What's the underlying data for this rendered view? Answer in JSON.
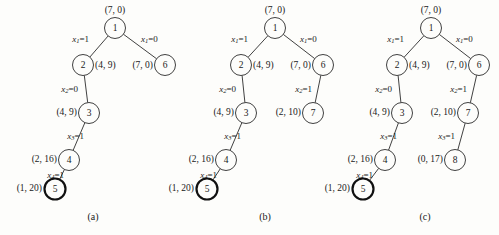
{
  "figure": {
    "background": "#fdfdfb",
    "ink": "#2b2b2b",
    "panels": [
      {
        "caption": "(a)",
        "caption_x": 93,
        "caption_y": 220,
        "nodes": [
          {
            "id": "n1",
            "label": "1",
            "x": 115,
            "y": 28,
            "r": 10.5,
            "goal": false,
            "pair": "(7, 0)",
            "pair_anchor": "mid",
            "pair_x": 115,
            "pair_y": 11
          },
          {
            "id": "n2",
            "label": "2",
            "x": 83,
            "y": 65,
            "r": 10.5,
            "goal": false,
            "pair": "(4, 9)",
            "pair_anchor": "left",
            "pair_x": 95,
            "pair_y": 66
          },
          {
            "id": "n6",
            "label": "6",
            "x": 165,
            "y": 65,
            "r": 10.5,
            "goal": false,
            "pair": "(7, 0)",
            "pair_anchor": "right",
            "pair_x": 153,
            "pair_y": 66
          },
          {
            "id": "n3",
            "label": "3",
            "x": 89,
            "y": 113,
            "r": 10.5,
            "goal": false,
            "pair": "(4, 9)",
            "pair_anchor": "right",
            "pair_x": 77,
            "pair_y": 113
          },
          {
            "id": "n4",
            "label": "4",
            "x": 69,
            "y": 160,
            "r": 10.5,
            "goal": false,
            "pair": "(2, 16)",
            "pair_anchor": "right",
            "pair_x": 57,
            "pair_y": 160
          },
          {
            "id": "n5",
            "label": "5",
            "x": 55,
            "y": 189,
            "r": 10.5,
            "goal": true,
            "pair": "(1, 20)",
            "pair_anchor": "right",
            "pair_x": 42,
            "pair_y": 189
          }
        ],
        "edges": [
          {
            "from": "n1",
            "to": "n2",
            "var": "x",
            "sub": "1",
            "val": "1",
            "lbl_x": 89,
            "lbl_y": 40,
            "lbl_anchor": "r"
          },
          {
            "from": "n1",
            "to": "n6",
            "var": "x",
            "sub": "1",
            "val": "0",
            "lbl_x": 141,
            "lbl_y": 40,
            "lbl_anchor": "l"
          },
          {
            "from": "n2",
            "to": "n3",
            "var": "x",
            "sub": "2",
            "val": "0",
            "lbl_x": 78,
            "lbl_y": 90,
            "lbl_anchor": "r"
          },
          {
            "from": "n3",
            "to": "n4",
            "var": "x",
            "sub": "3",
            "val": "1",
            "lbl_x": 84,
            "lbl_y": 137,
            "lbl_anchor": "r"
          },
          {
            "from": "n4",
            "to": "n5",
            "var": "x",
            "sub": "4",
            "val": "1",
            "lbl_x": 64,
            "lbl_y": 176,
            "lbl_anchor": "r"
          }
        ]
      },
      {
        "caption": "(b)",
        "caption_x": 265,
        "caption_y": 220,
        "nodes": [
          {
            "id": "n1",
            "label": "1",
            "x": 275,
            "y": 28,
            "r": 10.5,
            "goal": false,
            "pair": "(7, 0)",
            "pair_anchor": "mid",
            "pair_x": 275,
            "pair_y": 11
          },
          {
            "id": "n2",
            "label": "2",
            "x": 241,
            "y": 65,
            "r": 10.5,
            "goal": false,
            "pair": "(4, 9)",
            "pair_anchor": "left",
            "pair_x": 253,
            "pair_y": 66
          },
          {
            "id": "n6",
            "label": "6",
            "x": 323,
            "y": 65,
            "r": 10.5,
            "goal": false,
            "pair": "(7, 0)",
            "pair_anchor": "right",
            "pair_x": 311,
            "pair_y": 66
          },
          {
            "id": "n3",
            "label": "3",
            "x": 246,
            "y": 113,
            "r": 10.5,
            "goal": false,
            "pair": "(4, 9)",
            "pair_anchor": "right",
            "pair_x": 234,
            "pair_y": 113
          },
          {
            "id": "n7",
            "label": "7",
            "x": 313,
            "y": 113,
            "r": 10.5,
            "goal": false,
            "pair": "(2, 10)",
            "pair_anchor": "right",
            "pair_x": 301,
            "pair_y": 113
          },
          {
            "id": "n4",
            "label": "4",
            "x": 226,
            "y": 160,
            "r": 10.5,
            "goal": false,
            "pair": "(2, 16)",
            "pair_anchor": "right",
            "pair_x": 214,
            "pair_y": 160
          },
          {
            "id": "n5",
            "label": "5",
            "x": 207,
            "y": 189,
            "r": 10.5,
            "goal": true,
            "pair": "(1, 20)",
            "pair_anchor": "right",
            "pair_x": 194,
            "pair_y": 189
          }
        ],
        "edges": [
          {
            "from": "n1",
            "to": "n2",
            "var": "x",
            "sub": "1",
            "val": "1",
            "lbl_x": 248,
            "lbl_y": 40,
            "lbl_anchor": "r"
          },
          {
            "from": "n1",
            "to": "n6",
            "var": "x",
            "sub": "1",
            "val": "0",
            "lbl_x": 300,
            "lbl_y": 40,
            "lbl_anchor": "l"
          },
          {
            "from": "n2",
            "to": "n3",
            "var": "x",
            "sub": "2",
            "val": "0",
            "lbl_x": 236,
            "lbl_y": 90,
            "lbl_anchor": "r"
          },
          {
            "from": "n6",
            "to": "n7",
            "var": "x",
            "sub": "2",
            "val": "1",
            "lbl_x": 312,
            "lbl_y": 90,
            "lbl_anchor": "r"
          },
          {
            "from": "n3",
            "to": "n4",
            "var": "x",
            "sub": "3",
            "val": "1",
            "lbl_x": 241,
            "lbl_y": 137,
            "lbl_anchor": "r"
          },
          {
            "from": "n4",
            "to": "n5",
            "var": "x",
            "sub": "4",
            "val": "1",
            "lbl_x": 217,
            "lbl_y": 176,
            "lbl_anchor": "r"
          }
        ]
      },
      {
        "caption": "(c)",
        "caption_x": 425,
        "caption_y": 220,
        "nodes": [
          {
            "id": "n1",
            "label": "1",
            "x": 431,
            "y": 28,
            "r": 10.5,
            "goal": false,
            "pair": "(7, 0)",
            "pair_anchor": "mid",
            "pair_x": 431,
            "pair_y": 11
          },
          {
            "id": "n2",
            "label": "2",
            "x": 397,
            "y": 65,
            "r": 10.5,
            "goal": false,
            "pair": "(4, 9)",
            "pair_anchor": "left",
            "pair_x": 409,
            "pair_y": 66
          },
          {
            "id": "n6",
            "label": "6",
            "x": 479,
            "y": 65,
            "r": 10.5,
            "goal": false,
            "pair": "(7, 0)",
            "pair_anchor": "right",
            "pair_x": 467,
            "pair_y": 66
          },
          {
            "id": "n3",
            "label": "3",
            "x": 402,
            "y": 113,
            "r": 10.5,
            "goal": false,
            "pair": "(4, 9)",
            "pair_anchor": "right",
            "pair_x": 390,
            "pair_y": 113
          },
          {
            "id": "n7",
            "label": "7",
            "x": 468,
            "y": 113,
            "r": 10.5,
            "goal": false,
            "pair": "(2, 10)",
            "pair_anchor": "right",
            "pair_x": 456,
            "pair_y": 113
          },
          {
            "id": "n4",
            "label": "4",
            "x": 385,
            "y": 160,
            "r": 10.5,
            "goal": false,
            "pair": "(2, 16)",
            "pair_anchor": "right",
            "pair_x": 373,
            "pair_y": 160
          },
          {
            "id": "n8",
            "label": "8",
            "x": 455,
            "y": 160,
            "r": 10.5,
            "goal": false,
            "pair": "(0, 17)",
            "pair_anchor": "right",
            "pair_x": 443,
            "pair_y": 160
          },
          {
            "id": "n5",
            "label": "5",
            "x": 363,
            "y": 189,
            "r": 10.5,
            "goal": true,
            "pair": "(1, 20)",
            "pair_anchor": "right",
            "pair_x": 350,
            "pair_y": 189
          }
        ],
        "edges": [
          {
            "from": "n1",
            "to": "n2",
            "var": "x",
            "sub": "1",
            "val": "1",
            "lbl_x": 404,
            "lbl_y": 40,
            "lbl_anchor": "r"
          },
          {
            "from": "n1",
            "to": "n6",
            "var": "x",
            "sub": "1",
            "val": "0",
            "lbl_x": 456,
            "lbl_y": 40,
            "lbl_anchor": "l"
          },
          {
            "from": "n2",
            "to": "n3",
            "var": "x",
            "sub": "2",
            "val": "0",
            "lbl_x": 392,
            "lbl_y": 90,
            "lbl_anchor": "r"
          },
          {
            "from": "n6",
            "to": "n7",
            "var": "x",
            "sub": "2",
            "val": "1",
            "lbl_x": 467,
            "lbl_y": 90,
            "lbl_anchor": "r"
          },
          {
            "from": "n3",
            "to": "n4",
            "var": "x",
            "sub": "3",
            "val": "1",
            "lbl_x": 397,
            "lbl_y": 137,
            "lbl_anchor": "r"
          },
          {
            "from": "n7",
            "to": "n8",
            "var": "x",
            "sub": "3",
            "val": "1",
            "lbl_x": 455,
            "lbl_y": 137,
            "lbl_anchor": "r"
          },
          {
            "from": "n4",
            "to": "n5",
            "var": "x",
            "sub": "4",
            "val": "1",
            "lbl_x": 373,
            "lbl_y": 176,
            "lbl_anchor": "r"
          }
        ]
      }
    ]
  }
}
